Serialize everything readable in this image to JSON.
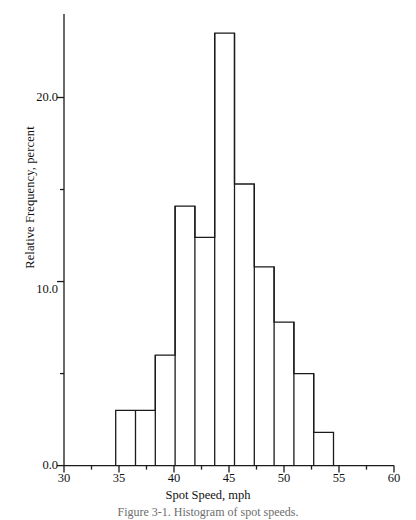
{
  "chart_data": {
    "type": "bar",
    "title": "",
    "subtitle": "",
    "caption": "Figure 3-1.  Histogram of spot speeds.",
    "xlabel": "Spot Speed, mph",
    "ylabel": "Relative Frequency, percent",
    "xlim": [
      30,
      60
    ],
    "ylim": [
      0.0,
      24.5
    ],
    "grid": false,
    "legend": null,
    "legend_position": "none",
    "x_ticks": [
      30,
      35,
      40,
      45,
      50,
      55,
      60
    ],
    "x_tick_labels": [
      "30",
      "35",
      "40",
      "45",
      "50",
      "55",
      "60"
    ],
    "x_minor_ticks": [
      32.5,
      37.5,
      42.5,
      47.5,
      52.5,
      57.5
    ],
    "y_ticks": [
      0.0,
      10.0,
      20.0
    ],
    "y_tick_labels": [
      "0.0",
      "10.0",
      "20.0"
    ],
    "y_minor_ticks": [
      5.0,
      15.0
    ],
    "bar_edges": [
      34.7,
      36.5,
      38.3,
      40.1,
      41.9,
      43.7,
      45.5,
      47.3,
      49.1,
      50.9,
      52.7,
      54.5,
      56.3
    ],
    "bin_width": 1.8,
    "categories": [
      "34.7-36.5",
      "36.5-38.3",
      "38.3-40.1",
      "40.1-41.9",
      "41.9-43.7",
      "43.7-45.5",
      "45.5-47.3",
      "47.3-49.1",
      "49.1-50.9",
      "50.9-52.7",
      "52.7-54.5",
      "54.5-56.3"
    ],
    "values": [
      3.0,
      3.0,
      3.0,
      6.0,
      14.1,
      12.4,
      23.5,
      15.3,
      10.8,
      7.8,
      5.0,
      1.8
    ],
    "bars": [
      {
        "x0": 34.7,
        "x1": 36.5,
        "value": 3.0
      },
      {
        "x0": 36.5,
        "x1": 38.3,
        "value": 3.0
      },
      {
        "x0": 38.3,
        "x1": 40.1,
        "value": 6.0
      },
      {
        "x0": 40.1,
        "x1": 41.9,
        "value": 14.1
      },
      {
        "x0": 41.9,
        "x1": 43.7,
        "value": 12.4
      },
      {
        "x0": 43.7,
        "x1": 45.5,
        "value": 23.5
      },
      {
        "x0": 45.5,
        "x1": 47.3,
        "value": 15.3
      },
      {
        "x0": 47.3,
        "x1": 49.1,
        "value": 10.8
      },
      {
        "x0": 49.1,
        "x1": 50.9,
        "value": 7.8
      },
      {
        "x0": 50.9,
        "x1": 52.7,
        "value": 5.0
      },
      {
        "x0": 52.7,
        "x1": 54.5,
        "value": 1.8
      }
    ],
    "bar_fill": "#ffffff",
    "bar_stroke": "#1a1a1a",
    "axis_color": "#1a1a1a"
  }
}
